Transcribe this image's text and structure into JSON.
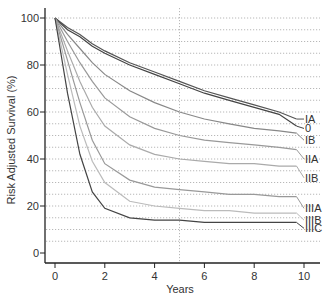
{
  "chart_data": {
    "type": "line",
    "title": "",
    "xlabel": "Years",
    "ylabel": "Risk Adjusted Survival (%)",
    "xlim": [
      0,
      10
    ],
    "ylim": [
      0,
      100
    ],
    "x_ticks": [
      "0",
      "2",
      "4",
      "6",
      "8",
      "10"
    ],
    "y_ticks": [
      "0",
      "20",
      "40",
      "60",
      "80",
      "100"
    ],
    "grid": {
      "horizontal_dotted_every": 5,
      "vertical_dotted_at": 5
    },
    "legend_position": "inline-right-labels",
    "x": [
      0,
      0.5,
      1,
      1.5,
      2,
      3,
      4,
      5,
      6,
      7,
      8,
      9,
      9.7
    ],
    "series": [
      {
        "name": "IA",
        "color": "#555555",
        "values": [
          100,
          96,
          93,
          89,
          86,
          81,
          77,
          73,
          69,
          66,
          63,
          60,
          57
        ]
      },
      {
        "name": "0",
        "color": "#444444",
        "values": [
          100,
          95,
          92,
          88,
          85,
          80,
          76,
          72,
          68,
          65,
          62,
          59,
          54
        ]
      },
      {
        "name": "IB",
        "color": "#888888",
        "values": [
          100,
          93,
          87,
          81,
          76,
          69,
          64,
          60,
          57,
          55,
          53,
          52,
          51
        ]
      },
      {
        "name": "IIA",
        "color": "#999999",
        "values": [
          100,
          90,
          81,
          73,
          66,
          58,
          53,
          50,
          48,
          47,
          46,
          45,
          44
        ]
      },
      {
        "name": "IIB",
        "color": "#aaaaaa",
        "values": [
          100,
          86,
          73,
          62,
          54,
          46,
          42,
          40,
          39,
          38,
          38,
          37,
          37
        ]
      },
      {
        "name": "IIIA",
        "color": "#999999",
        "values": [
          100,
          82,
          64,
          48,
          38,
          31,
          28,
          27,
          26,
          25,
          25,
          24,
          24
        ]
      },
      {
        "name": "IIIB",
        "color": "#bbbbbb",
        "values": [
          100,
          76,
          54,
          39,
          30,
          22,
          20,
          19,
          18,
          18,
          17,
          17,
          17
        ]
      },
      {
        "name": "IIIC",
        "color": "#444444",
        "values": [
          100,
          68,
          42,
          26,
          19,
          15,
          14,
          14,
          13,
          13,
          13,
          13,
          13
        ]
      }
    ]
  }
}
